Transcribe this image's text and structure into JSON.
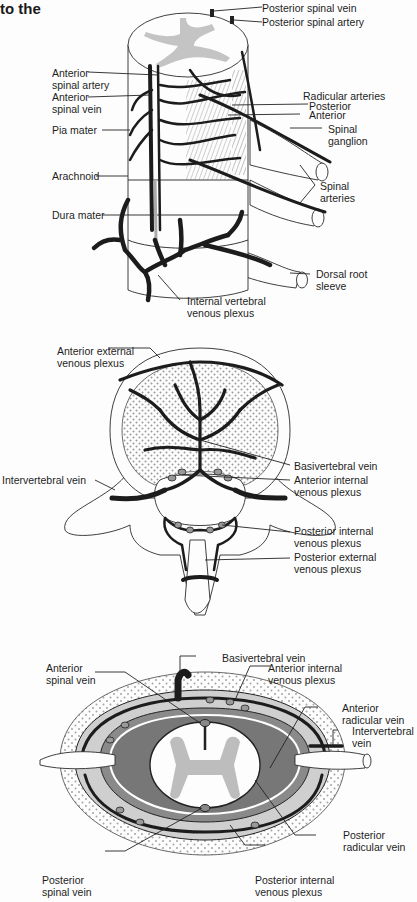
{
  "header": {
    "title_fragment": "to the"
  },
  "panel_top": {
    "name": "Spinal cord blood supply (perspective view)",
    "labels": {
      "posterior_spinal_vein": "Posterior spinal vein",
      "posterior_spinal_artery": "Posterior spinal artery",
      "anterior_spinal_artery": "Anterior\nspinal artery",
      "anterior_spinal_vein": "Anterior\nspinal vein",
      "pia_mater": "Pia mater",
      "arachnoid": "Arachnoid",
      "dura_mater": "Dura mater",
      "radicular_arteries": "Radicular arteries",
      "posterior": "Posterior",
      "anterior": "Anterior",
      "spinal_ganglion": "Spinal\nganglion",
      "spinal_arteries": "Spinal\narteries",
      "dorsal_root_sleeve": "Dorsal root\nsleeve",
      "internal_vertebral_venous_plexus": "Internal vertebral\nvenous plexus"
    }
  },
  "panel_middle": {
    "name": "Vertebral venous drainage (axial view)",
    "labels": {
      "anterior_external_venous_plexus": "Anterior external\nvenous plexus",
      "basivertebral_vein": "Basivertebral vein",
      "intervertebral_vein": "Intervertebral vein",
      "anterior_internal_venous_plexus": "Anterior internal\nvenous plexus",
      "posterior_internal_venous_plexus": "Posterior internal\nvenous plexus",
      "posterior_external_venous_plexus": "Posterior external\nvenous plexus"
    }
  },
  "panel_bottom": {
    "name": "Spinal canal cross-section",
    "labels": {
      "basivertebral_vein": "Basivertebral vein",
      "anterior_spinal_vein": "Anterior\nspinal vein",
      "anterior_internal_venous_plexus": "Anterior internal\nvenous plexus",
      "anterior_radicular_vein": "Anterior\nradicular vein",
      "intervertebral_vein": "Intervertebral\nvein",
      "posterior_radicular_vein": "Posterior\nradicular vein",
      "posterior_spinal_vein": "Posterior\nspinal vein",
      "posterior_internal_venous_plexus": "Posterior internal\nvenous plexus"
    }
  }
}
